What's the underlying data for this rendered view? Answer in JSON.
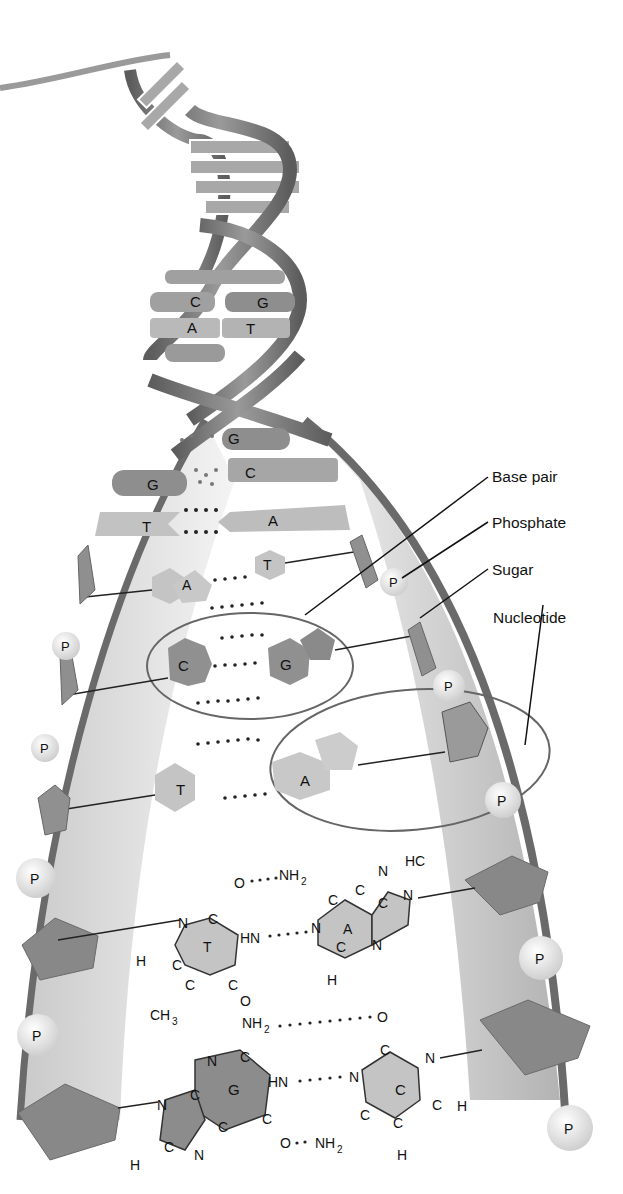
{
  "labels": {
    "base_pair": "Base pair",
    "phosphate": "Phosphate",
    "sugar": "Sugar",
    "nucleotide": "Nucleotide"
  },
  "helix_bases": {
    "upper": [
      {
        "left": "C",
        "right": "G"
      },
      {
        "left": "A",
        "right": "T"
      }
    ],
    "unwinding": [
      {
        "left": "",
        "right": "G"
      },
      {
        "left": "G",
        "right": "C"
      },
      {
        "left": "T",
        "right": "A"
      }
    ]
  },
  "ladder_pairs": [
    {
      "left": "A",
      "right": "T"
    },
    {
      "left": "C",
      "right": "G"
    },
    {
      "left": "T",
      "right": "A"
    }
  ],
  "phosphate_symbol": "P",
  "chem": {
    "ta_pair": {
      "t_label": "T",
      "a_label": "A",
      "atoms": [
        "O",
        "NH2",
        "N",
        "C",
        "HN",
        "H",
        "CH3",
        "HC",
        "C",
        "N"
      ]
    },
    "gc_pair": {
      "g_label": "G",
      "c_label": "C",
      "atoms": [
        "NH2",
        "O",
        "N",
        "C",
        "HN",
        "H",
        "NH2",
        "O"
      ]
    }
  },
  "colors": {
    "backbone_dark": "#6e6e6e",
    "backbone_light": "#bdbdbd",
    "base_dark": "#8c8c8c",
    "base_light": "#bfbfbf",
    "phosphate": "#ececec",
    "outline": "#555555"
  }
}
